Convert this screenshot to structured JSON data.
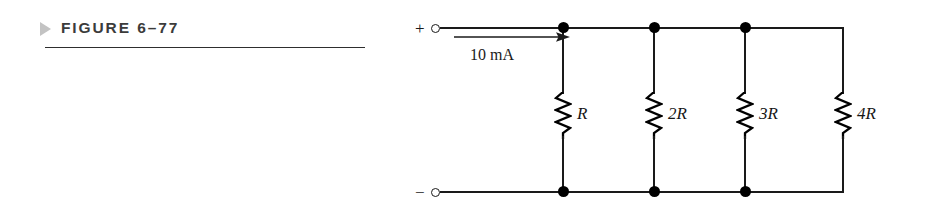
{
  "figure": {
    "marker_icon": "triangle-right-icon",
    "title": "FIGURE 6–77",
    "rule_color": "#2e2e2e",
    "marker_color": "#c3c3c3",
    "title_color": "#3b3b3b"
  },
  "circuit": {
    "wire_color": "#1a1a1a",
    "terminals": {
      "positive_symbol": "+",
      "negative_symbol": "−"
    },
    "source": {
      "current_label": "10 mA",
      "current_arrow_icon": "arrow-right-icon",
      "arrow_direction": "right"
    },
    "branches": [
      {
        "label": "R",
        "symbol_icon": "resistor-zigzag-icon",
        "x": 563
      },
      {
        "label": "2R",
        "symbol_icon": "resistor-zigzag-icon",
        "x": 654
      },
      {
        "label": "3R",
        "symbol_icon": "resistor-zigzag-icon",
        "x": 745
      },
      {
        "label": "4R",
        "symbol_icon": "resistor-zigzag-icon",
        "x": 843
      }
    ],
    "junction_icon": "junction-dot-icon",
    "terminal_icon": "open-terminal-icon",
    "rails": {
      "top_y": 28,
      "bottom_y": 192
    }
  }
}
